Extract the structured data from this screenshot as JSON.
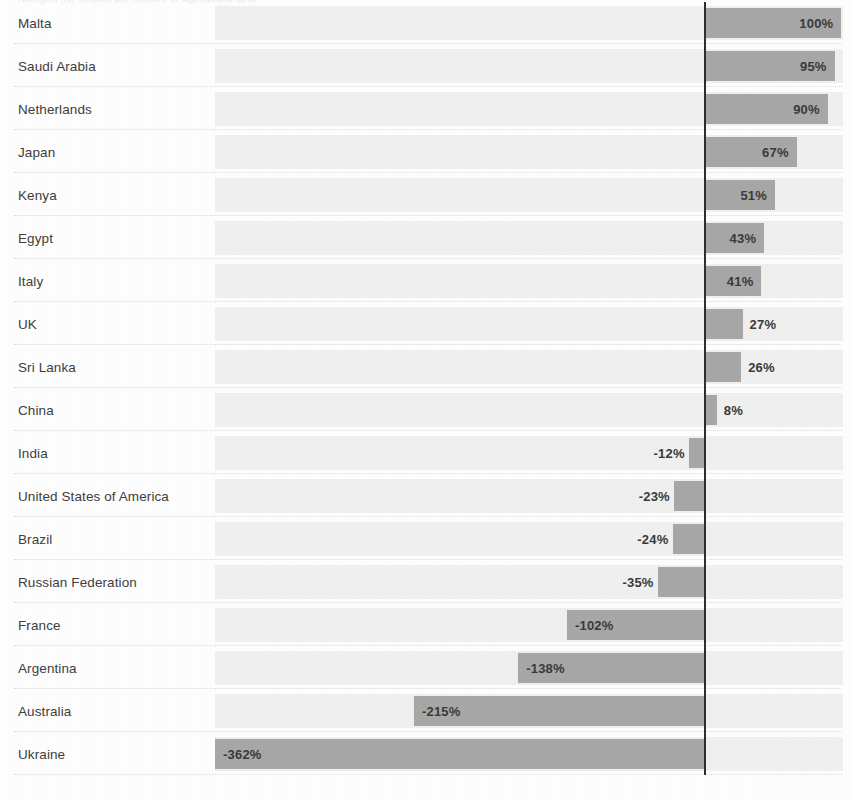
{
  "chart": {
    "clipped_title": "Nitrogen (N) surplus per hectare of agricultural land",
    "axis_zero_label": "0%"
  },
  "chart_data": {
    "type": "bar",
    "orientation": "horizontal",
    "title": "Nitrogen (N) surplus per hectare of agricultural land",
    "xlabel": "",
    "ylabel": "",
    "grid": false,
    "legend": "none",
    "zero_line": true,
    "value_suffix": "%",
    "xlim": [
      -362,
      100
    ],
    "categories": [
      "Malta",
      "Saudi Arabia",
      "Netherlands",
      "Japan",
      "Kenya",
      "Egypt",
      "Italy",
      "UK",
      "Sri Lanka",
      "China",
      "India",
      "United States of America",
      "Brazil",
      "Russian Federation",
      "France",
      "Argentina",
      "Australia",
      "Ukraine"
    ],
    "values": [
      100,
      95,
      90,
      67,
      51,
      43,
      41,
      27,
      26,
      8,
      -12,
      -23,
      -24,
      -35,
      -102,
      -138,
      -215,
      -362
    ],
    "value_labels": [
      "100%",
      "95%",
      "90%",
      "67%",
      "51%",
      "43%",
      "41%",
      "27%",
      "26%",
      "8%",
      "-12%",
      "-23%",
      "-24%",
      "-35%",
      "-102%",
      "-138%",
      "-215%",
      "-362%"
    ],
    "colors": {
      "bar": "#a8a8a8",
      "band": "#f1f1f1",
      "zero_line": "#2e2e2e",
      "label_text": "#3e3e3e",
      "background": "#ffffff"
    }
  }
}
